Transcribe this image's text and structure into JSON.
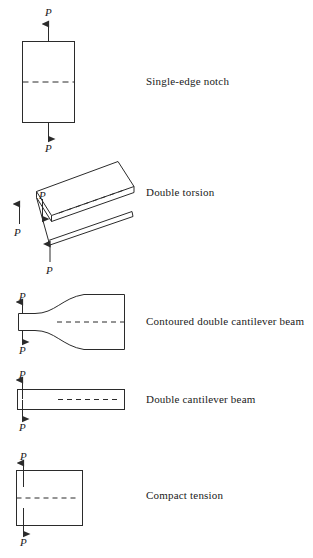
{
  "figure": {
    "line_color": "#2b2b2b",
    "text_color": "#1a1a1a",
    "background": "#ffffff",
    "load_symbol": "P"
  },
  "specimens": [
    {
      "id": "single-edge-notch",
      "caption": "Single-edge notch",
      "loads": [
        {
          "name": "top-load",
          "label": "P",
          "direction": "up"
        },
        {
          "name": "bottom-load",
          "label": "P",
          "direction": "down"
        }
      ]
    },
    {
      "id": "double-torsion",
      "caption": "Double  torsion",
      "loads": [
        {
          "name": "left-load",
          "label": "P",
          "direction": "up"
        },
        {
          "name": "center-load",
          "label": "P",
          "direction": "down"
        },
        {
          "name": "front-load",
          "label": "P",
          "direction": "up"
        }
      ]
    },
    {
      "id": "contoured-double-cantilever-beam",
      "caption": "Contoured double cantilever beam",
      "loads": [
        {
          "name": "top-load",
          "label": "P",
          "direction": "up"
        },
        {
          "name": "bottom-load",
          "label": "P",
          "direction": "down"
        }
      ]
    },
    {
      "id": "double-cantilever-beam",
      "caption": "Double cantilever beam",
      "loads": [
        {
          "name": "top-load",
          "label": "P",
          "direction": "up"
        },
        {
          "name": "bottom-load",
          "label": "P",
          "direction": "down"
        }
      ]
    },
    {
      "id": "compact-tension",
      "caption": "Compact  tension",
      "loads": [
        {
          "name": "top-load",
          "label": "P",
          "direction": "up"
        },
        {
          "name": "bottom-load",
          "label": "P",
          "direction": "down"
        }
      ]
    }
  ]
}
